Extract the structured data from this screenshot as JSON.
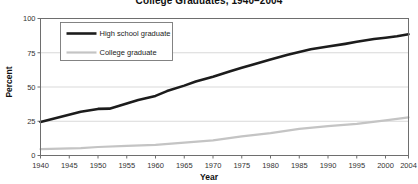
{
  "chart_data": {
    "type": "line",
    "title": "College Graduates, 1940–2004",
    "xlabel": "Year",
    "ylabel": "Percent",
    "xlim": [
      1940,
      2004
    ],
    "ylim": [
      0,
      100
    ],
    "yticks": [
      0,
      25,
      50,
      75,
      100
    ],
    "ytick_labels": [
      "0",
      "25",
      "50",
      "75",
      "100"
    ],
    "xticks": [
      1940,
      1945,
      1950,
      1955,
      1960,
      1965,
      1970,
      1975,
      1980,
      1985,
      1990,
      1995,
      2000,
      2004
    ],
    "xtick_labels": [
      "1940",
      "1945",
      "1950",
      "1955",
      "1960",
      "1965",
      "1970",
      "1975",
      "1980",
      "1985",
      "1990",
      "1995",
      "2000",
      "2004"
    ],
    "grid": "horizontal",
    "legend_position": "upper-left-inset",
    "series": [
      {
        "name": "High school graduate",
        "color": "#1c1c1c",
        "width": 2.6,
        "x": [
          1940,
          1947,
          1950,
          1952,
          1955,
          1957,
          1960,
          1962,
          1965,
          1967,
          1970,
          1973,
          1975,
          1977,
          1980,
          1983,
          1985,
          1987,
          1990,
          1993,
          1995,
          1998,
          2000,
          2002,
          2004
        ],
        "values": [
          24.5,
          32.0,
          34.0,
          34.2,
          38.0,
          40.5,
          43.5,
          47.0,
          51.0,
          54.0,
          57.5,
          61.5,
          64.0,
          66.5,
          70.0,
          73.5,
          75.5,
          77.5,
          79.5,
          81.5,
          83.0,
          85.0,
          86.0,
          87.0,
          88.5
        ]
      },
      {
        "name": "College graduate",
        "color": "#c4c4c4",
        "width": 2.2,
        "x": [
          1940,
          1947,
          1950,
          1955,
          1960,
          1965,
          1970,
          1975,
          1980,
          1985,
          1990,
          1995,
          2000,
          2004
        ],
        "values": [
          4.6,
          5.4,
          6.2,
          7.0,
          7.8,
          9.4,
          11.0,
          13.9,
          16.3,
          19.4,
          21.4,
          23.1,
          25.7,
          27.8
        ]
      }
    ]
  },
  "legend": {
    "entries": [
      {
        "label": "High school graduate"
      },
      {
        "label": "College graduate"
      }
    ]
  }
}
